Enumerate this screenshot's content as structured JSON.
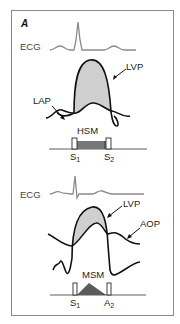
{
  "figure": {
    "panel_label": "A",
    "top": {
      "ecg_label": "ECG",
      "lvp_label": "LVP",
      "lap_label": "LAP",
      "murmur_label": "HSM",
      "s1_label": "S",
      "s1_sub": "1",
      "s2_label": "S",
      "s2_sub": "2"
    },
    "bottom": {
      "ecg_label": "ECG",
      "lvp_label": "LVP",
      "aop_label": "AOP",
      "murmur_label": "MSM",
      "s1_label": "S",
      "s1_sub": "1",
      "a2_label": "A",
      "a2_sub": "2"
    },
    "colors": {
      "trace": "#111111",
      "ecg": "#8a8a8a",
      "shade": "#cfcfcf",
      "frame": "#8a8a8a"
    }
  }
}
